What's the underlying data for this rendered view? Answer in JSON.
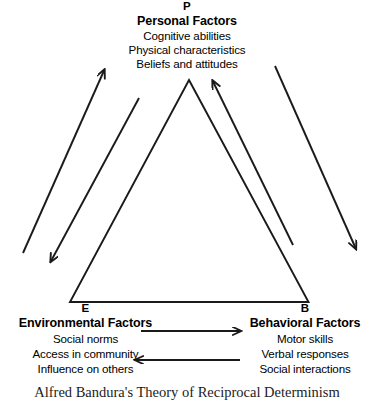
{
  "diagram": {
    "type": "reciprocal-determinism-triangle",
    "caption": "Alfred Bandura's Theory of Reciprocal Determinism",
    "stroke_color": "#1a1a1a",
    "background_color": "#ffffff",
    "nodes": {
      "personal": {
        "vertex_letter": "P",
        "title": "Personal Factors",
        "items": [
          "Cognitive abilities",
          "Physical characteristics",
          "Beliefs and attitudes"
        ]
      },
      "environmental": {
        "vertex_letter": "E",
        "title": "Environmental Factors",
        "items": [
          "Social norms",
          "Access in community",
          "Influence on others"
        ]
      },
      "behavioral": {
        "vertex_letter": "B",
        "title": "Behavioral Factors",
        "items": [
          "Motor skills",
          "Verbal responses",
          "Social interactions"
        ]
      }
    },
    "arrows": [
      {
        "name": "environmental-to-personal",
        "from": "E",
        "to": "P",
        "side": "left-outer"
      },
      {
        "name": "personal-to-environmental",
        "from": "P",
        "to": "E",
        "side": "left-inner"
      },
      {
        "name": "behavioral-to-personal",
        "from": "B",
        "to": "P",
        "side": "right-inner"
      },
      {
        "name": "personal-to-behavioral",
        "from": "P",
        "to": "B",
        "side": "right-outer"
      },
      {
        "name": "environmental-to-behavioral",
        "from": "E",
        "to": "B",
        "side": "bottom-upper"
      },
      {
        "name": "behavioral-to-environmental",
        "from": "B",
        "to": "E",
        "side": "bottom-lower"
      }
    ]
  }
}
